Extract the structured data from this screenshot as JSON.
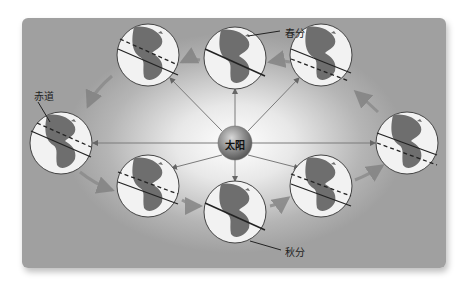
{
  "diagram": {
    "title": "",
    "labels": {
      "sun": "太阳",
      "vernal_equinox": "春分",
      "autumnal_equinox": "秋分",
      "equator": "赤道"
    },
    "colors": {
      "panel_edge": "#a0a0a0",
      "panel_center": "#ffffff",
      "arrow": "#808080",
      "globe_fill": "#f2f2f2",
      "land": "#6e6e6e",
      "sun": "#8a8a8a"
    },
    "sun": {
      "x": 235,
      "y": 143,
      "r": 17
    },
    "globes": [
      {
        "name": "top",
        "x": 235,
        "y": 58
      },
      {
        "name": "upper-right",
        "x": 321,
        "y": 55
      },
      {
        "name": "right",
        "x": 407,
        "y": 143
      },
      {
        "name": "lower-right",
        "x": 321,
        "y": 186
      },
      {
        "name": "bottom",
        "x": 235,
        "y": 212
      },
      {
        "name": "lower-left",
        "x": 148,
        "y": 186
      },
      {
        "name": "left",
        "x": 61,
        "y": 143
      },
      {
        "name": "upper-left",
        "x": 148,
        "y": 55
      }
    ]
  }
}
